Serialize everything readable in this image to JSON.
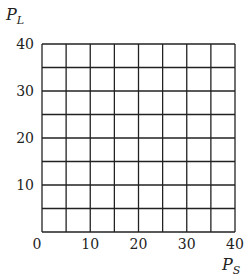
{
  "chart_data": {
    "type": "scatter",
    "title": "",
    "xlabel": "P_S",
    "ylabel": "P_L",
    "xlim": [
      0,
      40
    ],
    "ylim": [
      0,
      40
    ],
    "x_ticks": [
      0,
      10,
      20,
      30,
      40
    ],
    "y_ticks": [
      10,
      20,
      30,
      40
    ],
    "x_tick_labels": [
      "0",
      "10",
      "20",
      "30",
      "40"
    ],
    "y_tick_labels": [
      "10",
      "20",
      "30",
      "40"
    ],
    "grid": true,
    "grid_step": 5,
    "series": [],
    "note": "Blank grid with no plotted data"
  },
  "axes": {
    "x_label_main": "P",
    "x_label_sub": "S",
    "y_label_main": "P",
    "y_label_sub": "L"
  },
  "colors": {
    "grid": "#222222",
    "background": "#ffffff"
  }
}
